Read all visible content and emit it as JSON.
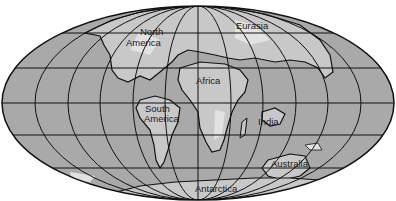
{
  "map": {
    "projection": "elliptical world map with graticule",
    "colors": {
      "ocean": "#a9a9a9",
      "land": "#c8c8c8",
      "land_highlight": "#e2e2e2",
      "outline": "#111111",
      "background": "#ffffff"
    },
    "labels": {
      "north_america_1": "North",
      "north_america_2": "America",
      "eurasia": "Eurasia",
      "africa": "Africa",
      "south_america_1": "South",
      "south_america_2": "America",
      "india": "India",
      "australia": "Australia",
      "antarctica": "Antarctica"
    }
  }
}
